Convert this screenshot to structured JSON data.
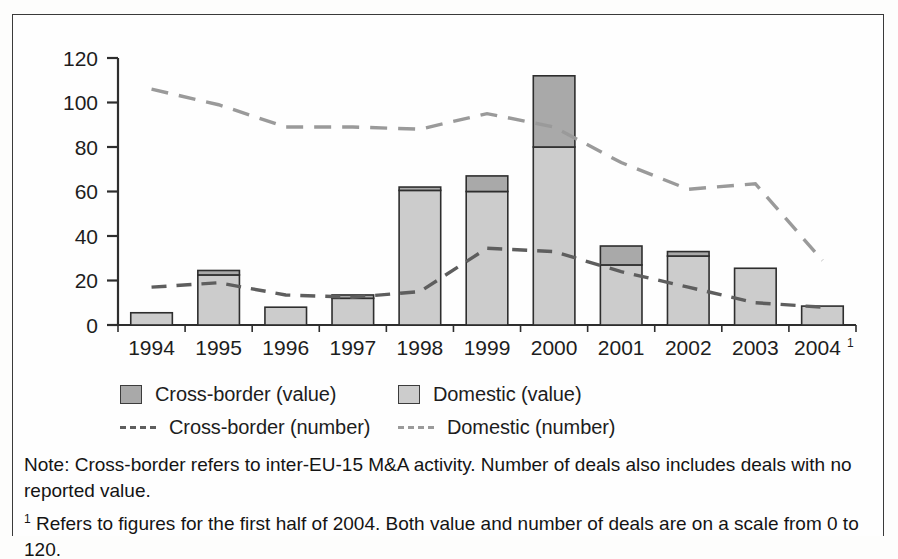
{
  "chart_data": {
    "type": "bar",
    "title": "",
    "subtitle": "",
    "xlabel": "",
    "ylabel": "",
    "ylim": [
      0,
      120
    ],
    "yticks": [
      0,
      20,
      40,
      60,
      80,
      100,
      120
    ],
    "grid": false,
    "legend_position": "below-plot",
    "categories": [
      "1994",
      "1995",
      "1996",
      "1997",
      "1998",
      "1999",
      "2000",
      "2001",
      "2002",
      "2003",
      "2004"
    ],
    "category_superscripts": [
      "",
      "",
      "",
      "",
      "",
      "",
      "",
      "",
      "",
      "",
      "1"
    ],
    "stacked_bars": true,
    "series": [
      {
        "name": "Domestic (value)",
        "type": "bar-segment",
        "color": "#cccccc",
        "values": [
          5.5,
          22.5,
          8,
          12,
          60.5,
          60,
          80,
          27,
          31,
          25.5,
          8.5
        ]
      },
      {
        "name": "Cross-border (value)",
        "type": "bar-segment",
        "color": "#a9a9a9",
        "values": [
          0,
          2,
          0,
          1.5,
          1.5,
          7,
          32,
          8.5,
          2,
          0,
          0
        ]
      },
      {
        "name": "Cross-border (number)",
        "type": "line-dashed",
        "color": "#5e5e5e",
        "values": [
          17,
          19,
          13.5,
          12.5,
          15,
          34.5,
          33,
          24,
          17,
          10,
          8
        ]
      },
      {
        "name": "Domestic (number)",
        "type": "line-dashed",
        "color": "#9a9a9a",
        "values": [
          106,
          99,
          89,
          89,
          88,
          95,
          89,
          73,
          61,
          63.5,
          29
        ]
      }
    ]
  },
  "legend": {
    "items": [
      {
        "label": "Cross-border (value)",
        "marker": "swatch-dark",
        "color": "#a9a9a9"
      },
      {
        "label": "Domestic (value)",
        "marker": "swatch-light",
        "color": "#cccccc"
      },
      {
        "label": "Cross-border (number)",
        "marker": "dash-dark",
        "color": "#5e5e5e"
      },
      {
        "label": "Domestic (number)",
        "marker": "dash-light",
        "color": "#9a9a9a"
      }
    ]
  },
  "notes": {
    "note_line": "Note: Cross-border refers to inter-EU-15 M&A activity. Number of deals also includes deals with no reported value.",
    "footnote_marker": "1",
    "footnote_line": "Refers to figures for the first half of 2004. Both value and number of deals are on a scale from 0 to 120."
  }
}
